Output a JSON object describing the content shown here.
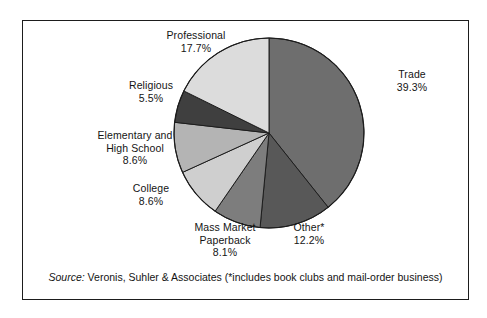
{
  "chart_data": {
    "type": "pie",
    "title": "",
    "subtitle": "",
    "xlabel": "",
    "ylabel": "",
    "legend_position": "none",
    "grid": false,
    "units": "percent",
    "start_angle_deg": 0,
    "direction": "clockwise",
    "categories": [
      "Trade",
      "Other*",
      "Mass Market Paperback",
      "College",
      "Elementary and High School",
      "Religious",
      "Professional"
    ],
    "values": [
      39.3,
      12.2,
      8.1,
      8.6,
      8.6,
      5.5,
      17.7
    ],
    "slices": [
      {
        "label": "Trade",
        "label_line1": "Trade",
        "value": 39.3,
        "value_text": "39.3%",
        "color": "#6e6e6e",
        "start_deg": 0,
        "end_deg": 141.48
      },
      {
        "label": "Other*",
        "label_line1": "Other*",
        "value": 12.2,
        "value_text": "12.2%",
        "color": "#585858",
        "start_deg": 141.48,
        "end_deg": 185.4
      },
      {
        "label": "Mass Market Paperback",
        "label_line1": "Mass Market",
        "label_line2": "Paperback",
        "value": 8.1,
        "value_text": "8.1%",
        "color": "#7d7d7d",
        "start_deg": 185.4,
        "end_deg": 214.56
      },
      {
        "label": "College",
        "label_line1": "College",
        "value": 8.6,
        "value_text": "8.6%",
        "color": "#cfcfcf",
        "start_deg": 214.56,
        "end_deg": 245.52
      },
      {
        "label": "Elementary and High School",
        "label_line1": "Elementary and",
        "label_line2": "High School",
        "value": 8.6,
        "value_text": "8.6%",
        "color": "#b4b4b4",
        "start_deg": 245.52,
        "end_deg": 276.48
      },
      {
        "label": "Religious",
        "label_line1": "Religious",
        "value": 5.5,
        "value_text": "5.5%",
        "color": "#3f3f3f",
        "start_deg": 276.48,
        "end_deg": 296.28
      },
      {
        "label": "Professional",
        "label_line1": "Professional",
        "value": 17.7,
        "value_text": "17.7%",
        "color": "#dcdcdc",
        "start_deg": 296.28,
        "end_deg": 360
      }
    ]
  },
  "labels": {
    "professional": {
      "name": "Professional",
      "pct": "17.7%"
    },
    "religious": {
      "name": "Religious",
      "pct": "5.5%"
    },
    "elementary_high_school": {
      "name_line1": "Elementary and",
      "name_line2": "High School",
      "pct": "8.6%"
    },
    "college": {
      "name": "College",
      "pct": "8.6%"
    },
    "mass_market_paperback": {
      "name_line1": "Mass Market",
      "name_line2": "Paperback",
      "pct": "8.1%"
    },
    "other": {
      "name": "Other*",
      "pct": "12.2%"
    },
    "trade": {
      "name": "Trade",
      "pct": "39.3%"
    }
  },
  "source": {
    "label": "Source:",
    "text": " Veronis, Suhler & Associates (*includes book clubs and mail-order business)"
  },
  "colors": {
    "outline": "#1d1d1d",
    "background": "#ffffff",
    "text": "#141414"
  }
}
